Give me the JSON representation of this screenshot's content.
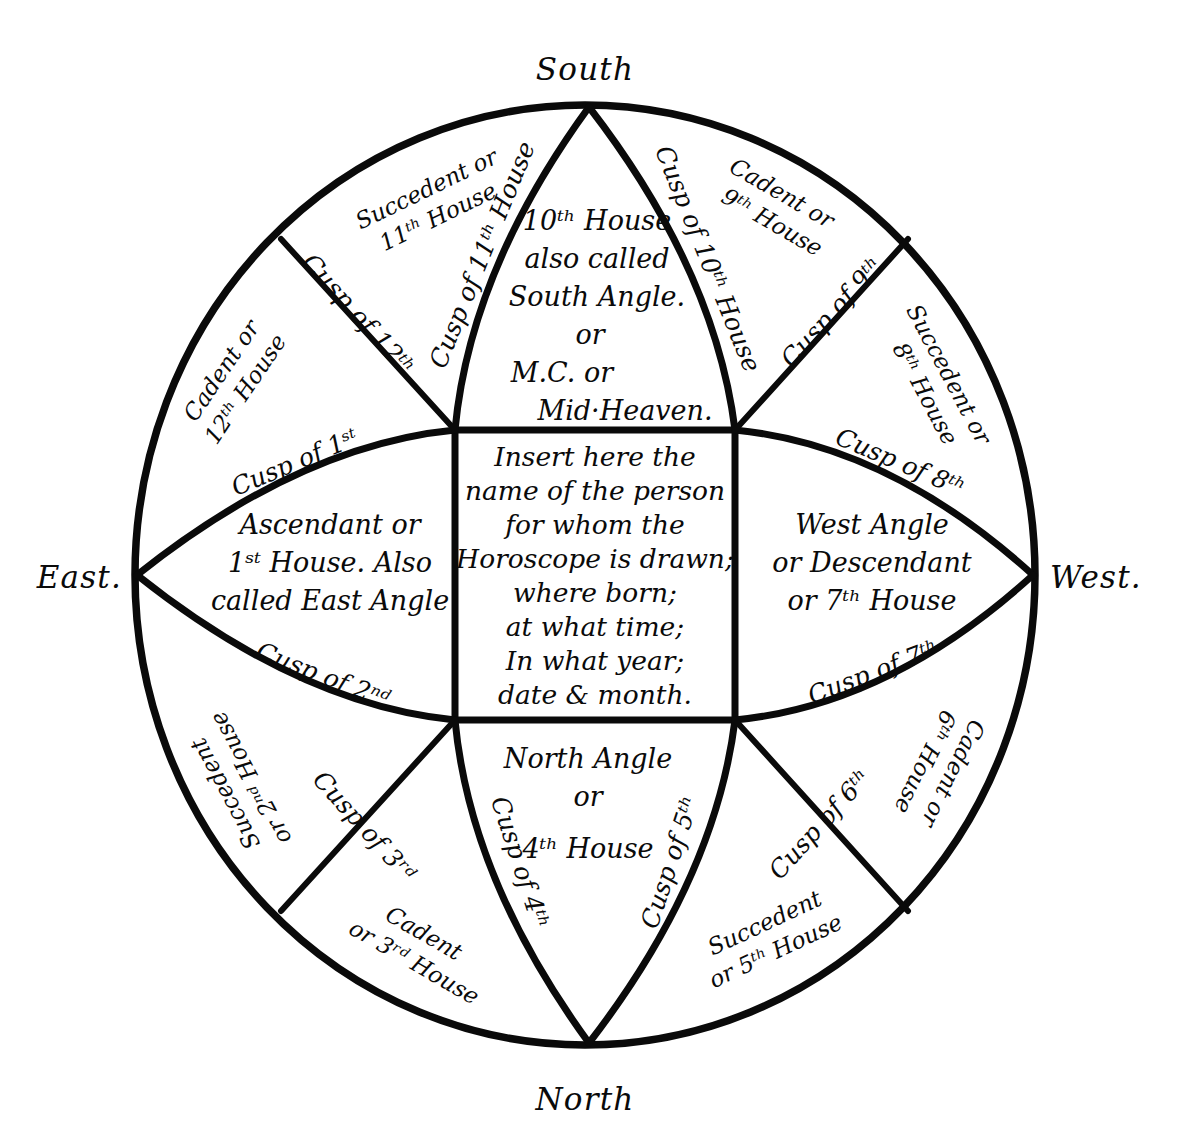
{
  "diagram": {
    "compass": {
      "south": "South",
      "north": "North",
      "east": "East.",
      "west": "West."
    },
    "centre_block": {
      "lines": [
        "Insert here the",
        "name of the person",
        "for whom the",
        "Horoscope is drawn;",
        "where born;",
        "at what time;",
        "In what year;",
        "date & month."
      ]
    },
    "houses": {
      "tenth": {
        "lines": [
          "10ᵗʰ House",
          "also called",
          "South Angle.",
          "or",
          "M.C. or",
          "Mid·Heaven."
        ]
      },
      "first": {
        "lines": [
          "Ascendant or",
          "1ˢᵗ House. Also",
          "called East Angle"
        ]
      },
      "seventh": {
        "lines": [
          "West Angle",
          "or Descendant",
          "or 7ᵗʰ House"
        ]
      },
      "fourth": {
        "lines": [
          "North Angle",
          "or",
          "4ᵗʰ House"
        ]
      }
    },
    "sectors": [
      {
        "id": "succedent-11",
        "line1": "Succedent or",
        "line2": "11ᵗʰ House"
      },
      {
        "id": "cadent-12",
        "line1": "Cadent or",
        "line2": "12ᵗʰ House"
      },
      {
        "id": "cadent-9",
        "line1": "Cadent or",
        "line2": "9ᵗʰ House"
      },
      {
        "id": "succedent-8",
        "line1": "Succedent or",
        "line2": "8ᵗʰ House"
      },
      {
        "id": "succedent-2",
        "line1": "Succedent",
        "line2": "or 2ⁿᵈ House"
      },
      {
        "id": "cadent-3",
        "line1": "Cadent",
        "line2": "or 3ʳᵈ House"
      },
      {
        "id": "succedent-5",
        "line1": "Succedent",
        "line2": "or 5ᵗʰ House"
      },
      {
        "id": "cadent-6",
        "line1": "Cadent or",
        "line2": "6ᵗʰ House"
      }
    ],
    "cusps": [
      {
        "id": "cusp-1",
        "label": "Cusp of 1ˢᵗ"
      },
      {
        "id": "cusp-2",
        "label": "Cusp of 2ⁿᵈ"
      },
      {
        "id": "cusp-3",
        "label": "Cusp of 3ʳᵈ"
      },
      {
        "id": "cusp-4",
        "label": "Cusp of 4ᵗʰ"
      },
      {
        "id": "cusp-5",
        "label": "Cusp of 5ᵗʰ"
      },
      {
        "id": "cusp-6",
        "label": "Cusp of 6ᵗʰ"
      },
      {
        "id": "cusp-7",
        "label": "Cusp of 7ᵗʰ"
      },
      {
        "id": "cusp-8",
        "label": "Cusp of 8ᵗʰ"
      },
      {
        "id": "cusp-9",
        "label": "Cusp of 9ᵗʰ"
      },
      {
        "id": "cusp-10",
        "label": "Cusp of 10ᵗʰ House"
      },
      {
        "id": "cusp-11",
        "label": "Cusp of 11ᵗʰ House"
      },
      {
        "id": "cusp-12",
        "label": "Cusp of 12ᵗʰ"
      }
    ],
    "colors": {
      "ink": "#0a0a0a",
      "paper": "#ffffff"
    }
  }
}
